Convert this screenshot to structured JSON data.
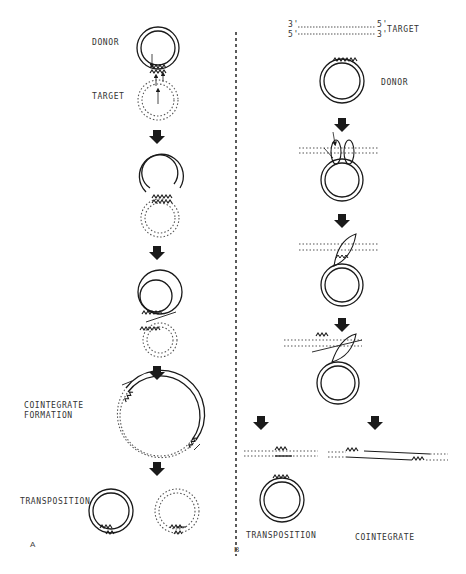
{
  "figure": {
    "panels": [
      {
        "id": "A",
        "label": "A",
        "steps": [
          {
            "name": "donor-target",
            "labels": {
              "donor": "DONOR",
              "target": "TARGET"
            }
          },
          {
            "name": "strand-transfer"
          },
          {
            "name": "replication-intermediate"
          },
          {
            "name": "cointegrate",
            "label_line1": "COINTEGRATE",
            "label_line2": "FORMATION"
          },
          {
            "name": "transposition",
            "label": "TRANSPOSITION"
          }
        ]
      },
      {
        "id": "B",
        "label": "B",
        "header": {
          "top_left": "3'",
          "bottom_left": "5'",
          "top_right": "5'",
          "bottom_right": "3'",
          "target": "TARGET"
        },
        "donor_label": "DONOR",
        "outcomes": {
          "left": "TRANSPOSITION",
          "right": "COINTEGRATE"
        }
      }
    ],
    "colors": {
      "line": "#1a1a1a",
      "dotted": "#555555",
      "background": "#ffffff"
    }
  }
}
